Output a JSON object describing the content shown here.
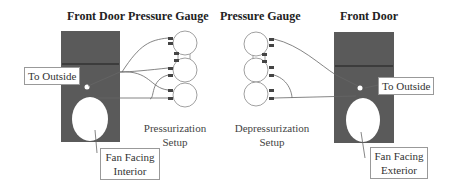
{
  "left_setup": {
    "door_title": "Front Door",
    "gauge_title": "Pressure Gauge",
    "outside_label": "To Outside",
    "fan_label_line1": "Fan Facing",
    "fan_label_line2": "Interior",
    "caption_line1": "Pressurization",
    "caption_line2": "Setup"
  },
  "right_setup": {
    "gauge_title": "Pressure Gauge",
    "door_title": "Front Door",
    "outside_label": "To Outside",
    "fan_label_line1": "Fan Facing",
    "fan_label_line2": "Exterior",
    "caption_line1": "Depressurization",
    "caption_line2": "Setup"
  },
  "colors": {
    "door": "#5a5a5a",
    "door_band": "#333333",
    "line": "#666666",
    "port": "#444444"
  }
}
